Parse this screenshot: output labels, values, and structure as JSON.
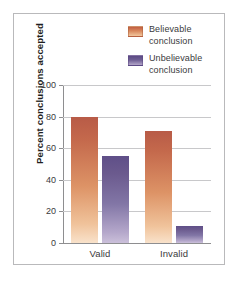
{
  "chart_data": {
    "type": "bar",
    "title": "",
    "xlabel": "",
    "ylabel": "Percent conclusions accepted",
    "categories": [
      "Valid",
      "Invalid"
    ],
    "series": [
      {
        "name": "Believable conclusion",
        "values": [
          80,
          71
        ],
        "color": "#c4694c"
      },
      {
        "name": "Unbelievable conclusion",
        "values": [
          55,
          11
        ],
        "color": "#6b5a8e"
      }
    ],
    "ylim": [
      0,
      100
    ],
    "yticks": [
      0,
      20,
      40,
      60,
      80,
      100
    ],
    "ytick_labels": [
      "0",
      "20",
      "40",
      "60",
      "80",
      "100"
    ],
    "grid": true,
    "legend_position": "top-right"
  },
  "legend": {
    "items": [
      {
        "line1": "Believable",
        "line2": "conclusion"
      },
      {
        "line1": "Unbelievable",
        "line2": "conclusion"
      }
    ]
  },
  "colors": {
    "believable_top": "#b85b47",
    "believable_bottom": "#f9e2cb",
    "unbelievable_top": "#5f4f88",
    "unbelievable_bottom": "#cbc0da",
    "gridline": "#c8c8ca",
    "axis": "#8e8e90",
    "frame": "#b9b9bb",
    "text": "#3a3a3c",
    "background": "#ffffff"
  }
}
